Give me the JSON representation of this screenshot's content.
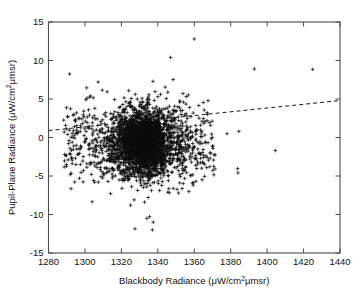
{
  "chart_data": {
    "type": "scatter",
    "title": "",
    "xlabel": "Blackbody Radiance (μW/cm²μmsr)",
    "ylabel": "Pupil-Plane Radiance (μW/cm²μmsr)",
    "xlabel_parts": {
      "main": "Blackbody Radiance (μW/cm",
      "sup": "2",
      "tail": "μmsr)"
    },
    "ylabel_parts": {
      "main": "Pupil-Plane Radiance (μW/cm",
      "sup": "2",
      "tail": "μmsr)"
    },
    "xlim": [
      1280,
      1440
    ],
    "ylim": [
      -15,
      15
    ],
    "xticks": [
      1280,
      1300,
      1320,
      1340,
      1360,
      1380,
      1400,
      1420,
      1440
    ],
    "xticklabels": [
      "1280",
      "1300",
      "1320",
      "1340",
      "1360",
      "1380",
      "1400",
      "1420",
      "1440"
    ],
    "yticks": [
      -15,
      -10,
      -5,
      0,
      5,
      10,
      15
    ],
    "yticklabels": [
      "-15",
      "-10",
      "-5",
      "0",
      "5",
      "10",
      "15"
    ],
    "grid": false,
    "legend": null,
    "marker": "plus",
    "marker_color": "#0d0d0d",
    "axis_color": "#4a4a4a",
    "background": "#ffffff",
    "trendline": {
      "style": "dashed",
      "color": "#1a1a1a",
      "x": [
        1280,
        1440
      ],
      "y": [
        0.9,
        4.8
      ],
      "slope": 0.0244,
      "intercept": -30.3
    },
    "cluster": {
      "description": "dense plus-marker cloud",
      "n_points": 2400,
      "x_center": 1332,
      "y_center": -0.6,
      "x_sigma": 8.5,
      "y_sigma": 2.15,
      "seed": 20240517
    },
    "outliers": [
      {
        "x": 1360.0,
        "y": 12.8
      },
      {
        "x": 1347.0,
        "y": 10.4
      },
      {
        "x": 1393.0,
        "y": 8.9
      },
      {
        "x": 1425.0,
        "y": 8.85
      },
      {
        "x": 1341.5,
        "y": 5.6
      },
      {
        "x": 1340.0,
        "y": 5.3
      },
      {
        "x": 1321.5,
        "y": 5.15
      },
      {
        "x": 1352.0,
        "y": 4.6
      },
      {
        "x": 1362.5,
        "y": 4.15
      },
      {
        "x": 1348.5,
        "y": 3.55
      },
      {
        "x": 1353.5,
        "y": 3.5
      },
      {
        "x": 1334.0,
        "y": 4.3
      },
      {
        "x": 1310.5,
        "y": 3.0
      },
      {
        "x": 1302.5,
        "y": 2.9
      },
      {
        "x": 1296.8,
        "y": 2.45
      },
      {
        "x": 1367.0,
        "y": 2.2
      },
      {
        "x": 1363.5,
        "y": 1.6
      },
      {
        "x": 1358.0,
        "y": 1.4
      },
      {
        "x": 1378.0,
        "y": 0.5
      },
      {
        "x": 1384.5,
        "y": 0.8
      },
      {
        "x": 1293.0,
        "y": 0.55
      },
      {
        "x": 1295.8,
        "y": 0.5
      },
      {
        "x": 1366.0,
        "y": -0.6
      },
      {
        "x": 1370.0,
        "y": -1.1
      },
      {
        "x": 1404.5,
        "y": -1.7
      },
      {
        "x": 1296.0,
        "y": -2.2
      },
      {
        "x": 1366.5,
        "y": -2.4
      },
      {
        "x": 1367.0,
        "y": -2.6
      },
      {
        "x": 1357.5,
        "y": -2.5
      },
      {
        "x": 1293.0,
        "y": -3.4
      },
      {
        "x": 1297.5,
        "y": -3.5
      },
      {
        "x": 1301.0,
        "y": -3.4
      },
      {
        "x": 1368.5,
        "y": -3.8
      },
      {
        "x": 1384.0,
        "y": -4.6
      },
      {
        "x": 1358.0,
        "y": -4.9
      },
      {
        "x": 1303.5,
        "y": -4.8
      },
      {
        "x": 1297.0,
        "y": -5.3
      },
      {
        "x": 1352.0,
        "y": -5.9
      },
      {
        "x": 1348.5,
        "y": -6.6
      },
      {
        "x": 1336.5,
        "y": -6.9
      },
      {
        "x": 1341.0,
        "y": -6.9
      },
      {
        "x": 1345.5,
        "y": -7.1
      },
      {
        "x": 1327.0,
        "y": -8.1
      },
      {
        "x": 1334.0,
        "y": -10.5
      },
      {
        "x": 1337.5,
        "y": -11.0
      },
      {
        "x": 1337.0,
        "y": -12.0
      }
    ]
  }
}
